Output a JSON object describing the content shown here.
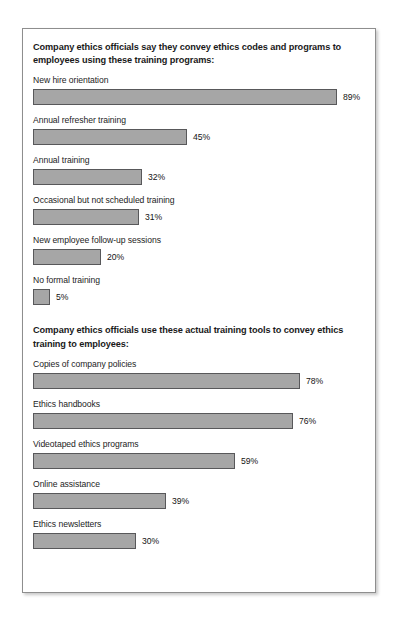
{
  "chart_data": {
    "type": "bar",
    "title": "",
    "xlabel": "",
    "ylabel": "",
    "xlim": [
      0,
      100
    ],
    "grid": false,
    "legend": "none",
    "orientation": "horizontal",
    "value_suffix": "%",
    "sections": [
      {
        "heading": "Company ethics officials say they convey ethics codes and programs to employees using these training programs:",
        "categories": [
          "New hire orientation",
          "Annual refresher training",
          "Annual training",
          "Occasional but not scheduled training",
          "New employee follow-up sessions",
          "No formal training"
        ],
        "values": [
          89,
          45,
          32,
          31,
          20,
          5
        ],
        "value_labels": [
          "89%",
          "45%",
          "32%",
          "31%",
          "20%",
          "5%"
        ]
      },
      {
        "heading": "Company ethics officials use these actual training tools to convey ethics training to employees:",
        "categories": [
          "Copies of company policies",
          "Ethics handbooks",
          "Videotaped ethics programs",
          "Online assistance",
          "Ethics newsletters"
        ],
        "values": [
          78,
          76,
          59,
          39,
          30
        ],
        "value_labels": [
          "78%",
          "76%",
          "59%",
          "39%",
          "30%"
        ]
      }
    ]
  },
  "colors": {
    "bar_fill": "#a6a6a6",
    "bar_border": "#58585a",
    "frame_border": "#8e8e8e",
    "text": "#1a1a1a",
    "background": "#ffffff"
  }
}
